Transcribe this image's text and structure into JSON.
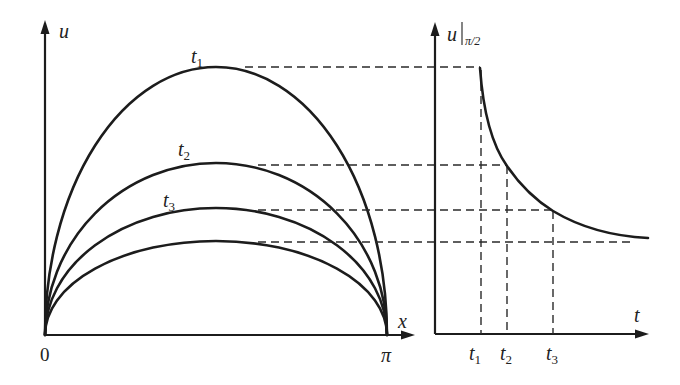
{
  "figure": {
    "colors": {
      "line": "#1c1c1c",
      "background": "#ffffff"
    },
    "left_panel": {
      "title": "Spatial profiles u(x) at successive times",
      "y_axis_label": "u",
      "x_axis_label": "x",
      "origin_label": "0",
      "x_end_label": "π",
      "curves": [
        {
          "label": "t",
          "subscript": "1",
          "peak_level": "highest"
        },
        {
          "label": "t",
          "subscript": "2",
          "peak_level": "second"
        },
        {
          "label": "t",
          "subscript": "3",
          "peak_level": "third"
        },
        {
          "label": "",
          "subscript": "",
          "peak_level": "lowest (unlabeled)"
        }
      ]
    },
    "right_panel": {
      "title": "Midpoint value over time",
      "y_axis_label": "u",
      "y_axis_subscript": "π/2",
      "x_axis_label": "t",
      "ticks": [
        {
          "label": "t",
          "subscript": "1"
        },
        {
          "label": "t",
          "subscript": "2"
        },
        {
          "label": "t",
          "subscript": "3"
        }
      ],
      "curve": "decreasing, decaying toward a lower level"
    }
  }
}
